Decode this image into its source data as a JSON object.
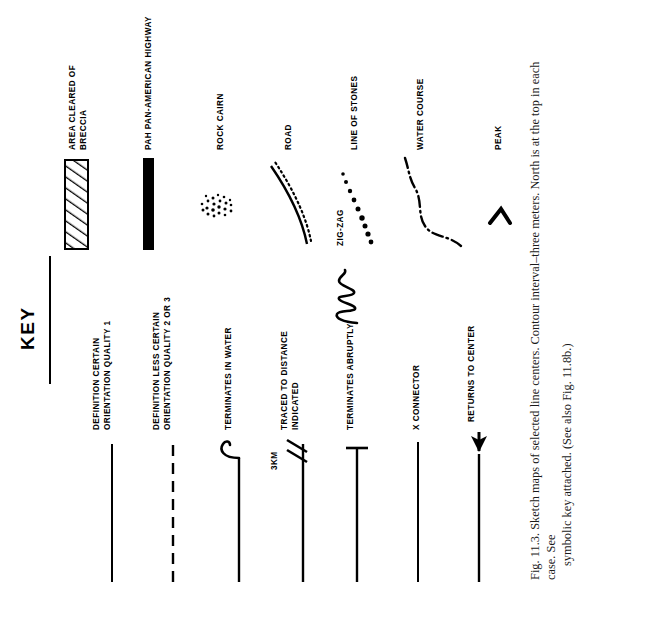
{
  "figure": {
    "key_title": "KEY",
    "caption_line1": "Fig. 11.3.   Sketch maps of selected line centers. Contour interval–three meters. North is at the top in each case. See",
    "caption_line2": "symbolic key attached. (See also Fig. 11.8b.)"
  },
  "legend": {
    "left_column": [
      {
        "id": "definition-certain",
        "label_line1": "DEFINITION CERTAIN",
        "label_line2": "ORIENTATION QUALITY 1",
        "symbol": "solid-line"
      },
      {
        "id": "definition-less-certain",
        "label_line1": "DEFINITION LESS CERTAIN",
        "label_line2": "ORIENTATION QUALITY 2 OR 3",
        "symbol": "dashed-line"
      },
      {
        "id": "terminates-in-water",
        "label_line1": "TERMINATES IN WATER",
        "label_line2": "",
        "symbol": "line-with-hook"
      },
      {
        "id": "traced-to-distance-indicated",
        "label_line1": "TRACED TO DISTANCE",
        "label_line2": "INDICATED",
        "symbol": "line-with-tick-marks",
        "annotation": "3KM"
      },
      {
        "id": "terminates-abruptly",
        "label_line1": "TERMINATES ABRUPTLY",
        "label_line2": "",
        "symbol": "line-with-crossbar"
      },
      {
        "id": "x-connector",
        "label_line1": "X CONNECTOR",
        "label_line2": "",
        "symbol": "plain-line"
      },
      {
        "id": "returns-to-center",
        "label_line1": "RETURNS TO CENTER",
        "label_line2": "",
        "symbol": "line-with-arrow"
      },
      {
        "id": "zig-zag",
        "label_line1": "ZIG-ZAG",
        "label_line2": "",
        "symbol": "zigzag-squiggle"
      }
    ],
    "right_column": [
      {
        "id": "area-cleared-of-breccia",
        "label_line1": "AREA CLEARED OF",
        "label_line2": "BRECCIA",
        "symbol": "hatched-bar"
      },
      {
        "id": "pan-american-highway",
        "label_line1": "PAH PAN-AMERICAN HIGHWAY",
        "label_line2": "",
        "symbol": "thick-solid-bar"
      },
      {
        "id": "rock-cairn",
        "label_line1": "ROCK CAIRN",
        "label_line2": "",
        "symbol": "stipple-cluster"
      },
      {
        "id": "road",
        "label_line1": "ROAD",
        "label_line2": "",
        "symbol": "solid-curve-with-dotted-parallel"
      },
      {
        "id": "line-of-stones",
        "label_line1": "LINE OF STONES",
        "label_line2": "",
        "symbol": "dot-chain"
      },
      {
        "id": "water-course",
        "label_line1": "WATER COURSE",
        "label_line2": "",
        "symbol": "dash-dot-curve"
      },
      {
        "id": "peak",
        "label_line1": "PEAK",
        "label_line2": "",
        "symbol": "chevron"
      }
    ]
  },
  "colors": {
    "ink": "#000000",
    "paper": "#ffffff",
    "caption_ink": "#1a1a1a"
  }
}
